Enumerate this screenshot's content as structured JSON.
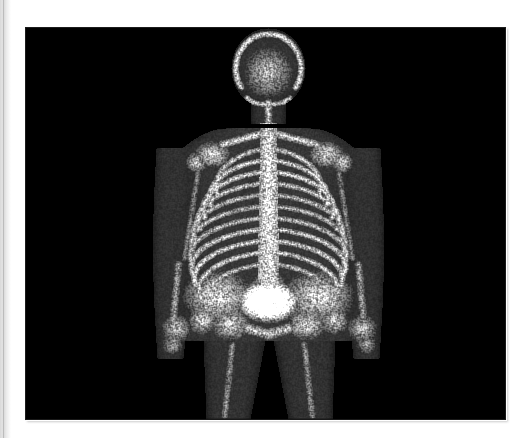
{
  "document": {
    "kind": "nuclear-medicine-bone-scan",
    "page_background_color": "#ffffff",
    "edge_strip_color": "#dcdcdc"
  },
  "scan": {
    "modality_label": "Whole-body bone scintigraphy, anterior view",
    "background_color": "#000000",
    "frame": {
      "x": 26,
      "y": 28,
      "width": 479,
      "height": 391
    },
    "orientation": "anterior",
    "grayscale_inverted": false,
    "palette": {
      "background": "#000000",
      "soft_tissue": "#2b2b2b",
      "soft_tissue_mid": "#3d3d3d",
      "bone_low": "#6e6e6e",
      "bone_mid": "#a5a5a5",
      "bone_high": "#d2d2d2",
      "hot_spot": "#ffffff"
    },
    "findings": [
      {
        "name": "skull-calvarium-uptake",
        "intensity": "high",
        "cx": 268,
        "cy": 63
      },
      {
        "name": "mandible-uptake",
        "intensity": "high",
        "cx": 268,
        "cy": 88
      },
      {
        "name": "shoulder-girdle-uptake",
        "intensity": "high",
        "cx": 268,
        "cy": 128
      },
      {
        "name": "rib-cage-uptake",
        "intensity": "high",
        "cx": 268,
        "cy": 190
      },
      {
        "name": "thoracolumbar-spine-uptake",
        "intensity": "very-high",
        "cx": 268,
        "cy": 195
      },
      {
        "name": "spine-focal-hot-spot",
        "intensity": "focal-very-high",
        "cx": 268,
        "cy": 182
      },
      {
        "name": "pelvis-uptake",
        "intensity": "high",
        "cx": 268,
        "cy": 295
      },
      {
        "name": "urinary-bladder-activity",
        "intensity": "maximum",
        "cx": 268,
        "cy": 301
      },
      {
        "name": "proximal-femora-uptake",
        "intensity": "moderate",
        "cx": 268,
        "cy": 355
      },
      {
        "name": "forearm-and-hand-uptake",
        "intensity": "moderate",
        "cx": 186,
        "cy": 318
      }
    ]
  },
  "body_geometry": {
    "note": "Coordinates are in scan-frame pixel space (479 x 391).",
    "head": {
      "cx": 242,
      "cy": 40,
      "rx": 37,
      "ry": 40
    },
    "neck": {
      "cx": 242,
      "cy": 82,
      "w": 34,
      "h": 26
    },
    "shoulders": {
      "left_x": 152,
      "right_x": 332,
      "y": 108
    },
    "torso": {
      "cx": 242,
      "top": 100,
      "bottom": 270,
      "half_width": 92
    },
    "waist": {
      "cx": 242,
      "y": 250,
      "half_width": 80
    },
    "pelvis": {
      "cx": 242,
      "cy": 282,
      "half_width": 86
    },
    "bladder": {
      "cx": 242,
      "cy": 273,
      "rx": 16,
      "ry": 11
    },
    "spine": {
      "x": 242,
      "top": 95,
      "bottom": 268,
      "half_width": 9
    },
    "left_arm": {
      "x": 148,
      "top": 120,
      "bottom": 330
    },
    "right_arm": {
      "x": 336,
      "top": 120,
      "bottom": 330
    },
    "legs": {
      "left_cx": 208,
      "right_cx": 278,
      "top": 312,
      "bottom": 391,
      "half_width": 30
    }
  }
}
